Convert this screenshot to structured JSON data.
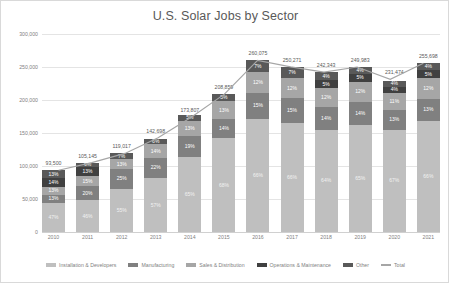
{
  "chart_data": {
    "type": "bar",
    "subtype": "stacked-bar-with-line",
    "title": "U.S. Solar Jobs by Sector",
    "xlabel": "",
    "ylabel": "",
    "ylim": [
      0,
      300000
    ],
    "yticks": [
      "0",
      "50,000",
      "100,000",
      "150,000",
      "200,000",
      "250,000",
      "300,000"
    ],
    "ytick_values": [
      0,
      50000,
      100000,
      150000,
      200000,
      250000,
      300000
    ],
    "grid": true,
    "legend_position": "bottom",
    "categories": [
      "2010",
      "2011",
      "2012",
      "2013",
      "2014",
      "2015",
      "2016",
      "2017",
      "2018",
      "2019",
      "2020",
      "2021"
    ],
    "totals": [
      93500,
      105145,
      119017,
      142698,
      173807,
      208859,
      260075,
      250271,
      242343,
      249983,
      231474,
      255698
    ],
    "total_labels": [
      "93,500",
      "105,145",
      "119,017",
      "142,698",
      "173,807",
      "208,859",
      "260,075",
      "250,271",
      "242,343",
      "249,983",
      "231,474",
      "255,698"
    ],
    "series": [
      {
        "name": "Installation & Developers",
        "color": "#bfbfbf",
        "text_color": "#f2f2f2",
        "percents": [
          47,
          46,
          55,
          57,
          65,
          68,
          66,
          66,
          64,
          65,
          67,
          66
        ],
        "labels": [
          "47%",
          "46%",
          "55%",
          "57%",
          "65%",
          "68%",
          "66%",
          "66%",
          "64%",
          "65%",
          "67%",
          "66%"
        ]
      },
      {
        "name": "Manufacturing",
        "color": "#808080",
        "text_color": "#ffffff",
        "percents": [
          13,
          20,
          25,
          22,
          19,
          14,
          15,
          15,
          14,
          14,
          13,
          13
        ],
        "labels": [
          "13%",
          "20%",
          "25%",
          "22%",
          "19%",
          "14%",
          "15%",
          "15%",
          "14%",
          "14%",
          "13%",
          "13%"
        ]
      },
      {
        "name": "Sales & Distribution",
        "color": "#a6a6a6",
        "text_color": "#ffffff",
        "percents": [
          13,
          15,
          13,
          14,
          13,
          13,
          12,
          12,
          12,
          12,
          11,
          12
        ],
        "labels": [
          "13%",
          "15%",
          "13%",
          "14%",
          "13%",
          "13%",
          "12%",
          "12%",
          "12%",
          "12%",
          "11%",
          "12%"
        ]
      },
      {
        "name": "Operations & Maintenance",
        "color": "#404040",
        "text_color": "#ffffff",
        "percents": [
          14,
          13,
          0,
          0,
          0,
          0,
          0,
          0,
          5,
          5,
          4,
          5
        ],
        "labels": [
          "14%",
          "13%",
          "",
          "",
          "",
          "",
          "",
          "",
          "5%",
          "5%",
          "4%",
          "5%"
        ]
      },
      {
        "name": "Other",
        "color": "#595959",
        "text_color": "#ffffff",
        "percents": [
          13,
          6,
          7,
          6,
          5,
          5,
          7,
          7,
          5,
          4,
          4,
          4
        ],
        "labels": [
          "13%",
          "6%",
          "7%",
          "6%",
          "5%",
          "5%",
          "7%",
          "7%",
          "4%",
          "4%",
          "4%",
          "4%"
        ]
      }
    ],
    "line_series": {
      "name": "Total",
      "color": "#a6a6a6",
      "values": [
        93500,
        105145,
        119017,
        142698,
        173807,
        208859,
        260075,
        250271,
        242343,
        249983,
        231474,
        255698
      ]
    },
    "legend": [
      {
        "label": "Installation & Developers",
        "color": "#bfbfbf",
        "marker": "square"
      },
      {
        "label": "Manufacturing",
        "color": "#808080",
        "marker": "square"
      },
      {
        "label": "Sales & Distribution",
        "color": "#a6a6a6",
        "marker": "square"
      },
      {
        "label": "Operations & Maintenance",
        "color": "#404040",
        "marker": "square"
      },
      {
        "label": "Other",
        "color": "#595959",
        "marker": "square"
      },
      {
        "label": "Total",
        "color": "#a6a6a6",
        "marker": "line"
      }
    ]
  }
}
